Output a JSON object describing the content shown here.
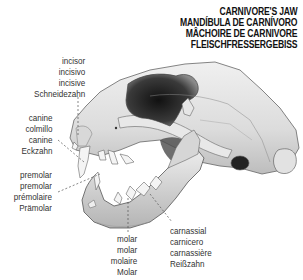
{
  "title": {
    "lines": [
      "CARNIVORE'S JAW",
      "MANDÍBULA DE CARNÍVORO",
      "MÂCHOIRE DE CARNIVORE",
      "FLEISCHFRESSERGEBISS"
    ]
  },
  "labels": {
    "incisor": [
      "incisor",
      "incisivo",
      "incisive",
      "Schneidezahn"
    ],
    "canine": [
      "canine",
      "colmillo",
      "canine",
      "Eckzahn"
    ],
    "premolar": [
      "premolar",
      "premolar",
      "prémolaire",
      "Prämolar"
    ],
    "molar": [
      "molar",
      "molar",
      "molaire",
      "Molar"
    ],
    "carnassial": [
      "carnassial",
      "carnicero",
      "carnassière",
      "Reißzahn"
    ]
  },
  "colors": {
    "bone": "#e4e4e4",
    "bone_shadow": "#b9b9b9",
    "cavity": "#2a2a2a",
    "outline": "#555555",
    "text": "#222222"
  }
}
